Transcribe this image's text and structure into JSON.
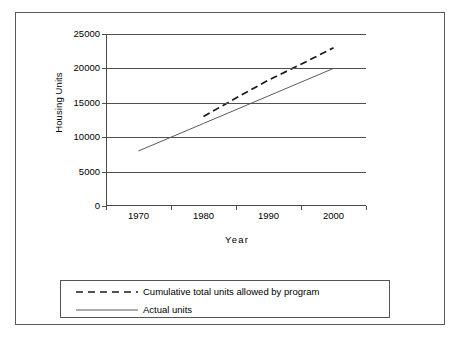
{
  "chart_data": {
    "type": "line",
    "title": "",
    "xlabel": "Year",
    "ylabel": "Housing Units",
    "x": [
      1970,
      1980,
      1990,
      2000
    ],
    "xlim": [
      1965,
      2005
    ],
    "ylim": [
      0,
      25000
    ],
    "ytick_labels": [
      "0",
      "5000",
      "10000",
      "15000",
      "20000",
      "25000"
    ],
    "ytick_values": [
      0,
      5000,
      10000,
      15000,
      20000,
      25000
    ],
    "xtick_labels": [
      "1970",
      "1980",
      "1990",
      "2000"
    ],
    "grid": "horizontal",
    "legend_position": "bottom",
    "series": [
      {
        "name": "Cumulative total units allowed by program",
        "style": "dashed",
        "color": "#1a1a1a",
        "x": [
          1980,
          1985,
          1990,
          1995,
          2000
        ],
        "values": [
          13000,
          15700,
          18300,
          20600,
          23000
        ]
      },
      {
        "name": "Actual units",
        "style": "solid",
        "color": "#5a5a5a",
        "x": [
          1970,
          1980,
          1990,
          2000
        ],
        "values": [
          8000,
          12000,
          16000,
          20000
        ]
      }
    ]
  },
  "axes": {
    "y_title": "Housing Units",
    "x_title": "Year"
  },
  "legend": {
    "items": [
      {
        "label": "Cumulative total units allowed by program",
        "style": "dashed"
      },
      {
        "label": "Actual units",
        "style": "solid"
      }
    ]
  }
}
